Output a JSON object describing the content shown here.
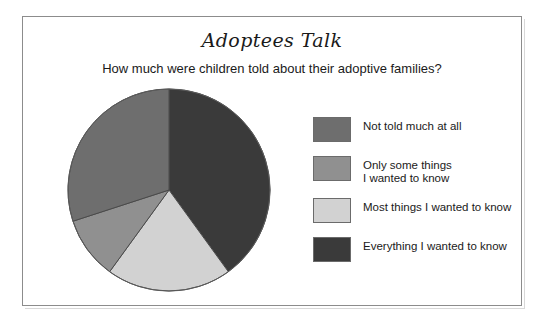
{
  "figure": {
    "title": "Adoptees Talk",
    "subtitle": "How much were children told about their adoptive families?"
  },
  "legend": {
    "items": [
      {
        "label": "Not told much at all",
        "color": "#6e6e6e"
      },
      {
        "label": "Only some things\nI wanted to know",
        "color": "#909090"
      },
      {
        "label": "Most things I wanted to know",
        "color": "#d2d2d2"
      },
      {
        "label": "Everything I wanted to know",
        "color": "#3a3a3a"
      }
    ]
  },
  "chart_data": {
    "type": "pie",
    "title": "Adoptees Talk",
    "subtitle": "How much were children told about their adoptive families?",
    "categories": [
      "Everything I wanted to know",
      "Most things I wanted to know",
      "Only some things I wanted to know",
      "Not told much at all"
    ],
    "values": [
      40,
      20,
      10,
      30
    ],
    "unit": "percent",
    "colors": [
      "#3a3a3a",
      "#d2d2d2",
      "#909090",
      "#6e6e6e"
    ],
    "start_angle_deg": 0,
    "direction": "clockwise",
    "legend_position": "right",
    "grid": false,
    "slices": [
      {
        "label": "Everything I wanted to know",
        "value": 40,
        "start_deg": 0,
        "end_deg": 144,
        "color": "#3a3a3a"
      },
      {
        "label": "Most things I wanted to know",
        "value": 20,
        "start_deg": 144,
        "end_deg": 216,
        "color": "#d2d2d2"
      },
      {
        "label": "Only some things I wanted to know",
        "value": 10,
        "start_deg": 216,
        "end_deg": 252,
        "color": "#909090"
      },
      {
        "label": "Not told much at all",
        "value": 30,
        "start_deg": 252,
        "end_deg": 360,
        "color": "#6e6e6e"
      }
    ]
  }
}
